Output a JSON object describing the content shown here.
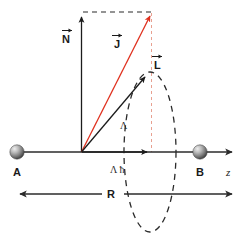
{
  "figure": {
    "background_color": "#ffffff"
  },
  "colors": {
    "vector_black": "#1c1c1c",
    "vector_red": "#e0301e",
    "dashed_red": "#e8a090",
    "axis": "#2b2b2b",
    "sphere_light": "#e8e8e8",
    "sphere_mid": "#9a9a9a",
    "sphere_dark": "#4a4a4a",
    "text": "#1a1a1a"
  },
  "labels": {
    "atom_a": "A",
    "atom_b": "B",
    "axis_z": "z",
    "vector_n": "N",
    "vector_j": "J",
    "vector_l": "L",
    "lambda_hbar": "Λ ħ",
    "lambda": "Λ",
    "internuclear_distance": "R",
    "arrow_accent": "→"
  },
  "geometry": {
    "origin_x": 81,
    "origin_y": 152,
    "atom_a_x": 17,
    "atom_b_x": 200,
    "axis_y": 152,
    "axis_start_x": 17,
    "axis_end_x": 236,
    "sphere_radius": 7,
    "n_tip_y": 12,
    "j_tip_x": 152,
    "j_tip_y": 11,
    "l_tip_x": 148,
    "l_tip_y": 72,
    "lambda_arrow_tip_x": 152,
    "ellipse_cx": 150,
    "ellipse_cy": 152,
    "ellipse_rx": 26,
    "ellipse_ry": 80,
    "r_arrow_y": 194,
    "r_arrow_left_x": 14,
    "r_arrow_right_x": 236
  },
  "elements": {
    "vectors": [
      {
        "name": "N",
        "color": "#1c1c1c",
        "from": "origin",
        "to": "top",
        "style": "solid"
      },
      {
        "name": "J",
        "color": "#e0301e",
        "from": "origin",
        "to": "top-right",
        "style": "solid"
      },
      {
        "name": "L",
        "color": "#1c1c1c",
        "from": "origin",
        "to": "ellipse-apex",
        "style": "solid"
      }
    ],
    "dashed_guides": [
      {
        "name": "top-horizontal",
        "color": "#2b2b2b"
      },
      {
        "name": "j-vertical-drop",
        "color": "#e8a090"
      }
    ],
    "spheres": [
      {
        "name": "atom-a",
        "label": "A"
      },
      {
        "name": "atom-b",
        "label": "B"
      }
    ],
    "measurements": [
      {
        "name": "R",
        "label": "R",
        "type": "double-arrow"
      },
      {
        "name": "lambda-hbar",
        "label": "Λ ħ",
        "type": "single-arrow-on-axis"
      }
    ]
  }
}
